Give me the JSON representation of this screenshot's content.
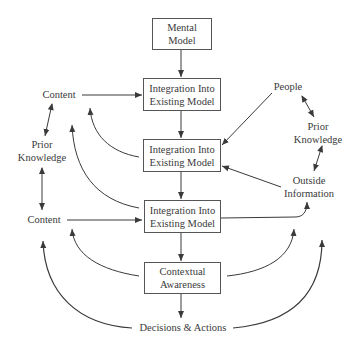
{
  "diagram": {
    "boxes": {
      "mental_model": [
        "Mental",
        "Model"
      ],
      "integration_1": [
        "Integration Into",
        "Existing Model"
      ],
      "integration_2": [
        "Integration Into",
        "Existing Model"
      ],
      "integration_3": [
        "Integration Into",
        "Existing Model"
      ],
      "contextual_awareness": [
        "Contextual",
        "Awareness"
      ]
    },
    "labels": {
      "content_top": "Content",
      "prior_knowledge_left": [
        "Prior",
        "Knowledge"
      ],
      "content_bottom": "Content",
      "people": "People",
      "prior_knowledge_right": [
        "Prior",
        "Knowledge"
      ],
      "outside_information": [
        "Outside",
        "Information"
      ],
      "decisions_actions": "Decisions & Actions"
    },
    "colors": {
      "line": "#3a3a3a",
      "box_border": "#555555",
      "background": "#ffffff"
    }
  }
}
